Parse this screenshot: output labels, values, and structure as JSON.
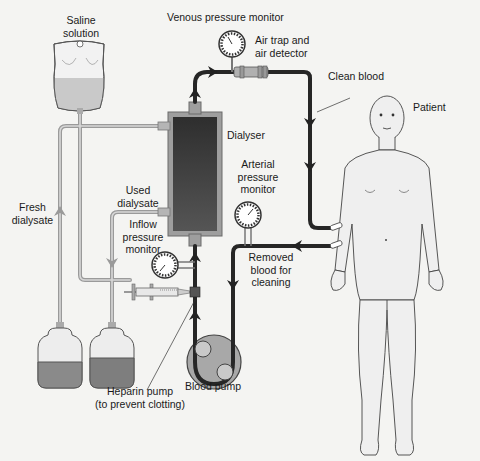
{
  "diagram": {
    "colors": {
      "background": "#f4f4f2",
      "blood_line": "#2a2a2a",
      "dialyser_inner": "#3c3c3c",
      "dialyser_outer": "#9a9a9a",
      "dialysate_tube": "#b8b8b8",
      "fluid": "#8a8a8a",
      "skin": "#e6e6e6"
    },
    "labels": {
      "saline": [
        "Saline",
        "solution"
      ],
      "venous_monitor": "Venous pressure monitor",
      "air_trap": [
        "Air trap and",
        "air detector"
      ],
      "clean_blood": "Clean blood",
      "patient": "Patient",
      "dialyser": "Dialyser",
      "arterial_monitor": [
        "Arterial",
        "pressure",
        "monitor"
      ],
      "used_dialysate": [
        "Used",
        "dialysate"
      ],
      "inflow_monitor": [
        "Inflow",
        "pressure",
        "monitor"
      ],
      "fresh_dialysate": [
        "Fresh",
        "dialysate"
      ],
      "removed_blood": [
        "Removed",
        "blood for",
        "cleaning"
      ],
      "blood_pump": "Blood pump",
      "heparin_pump": [
        "Heparin pump",
        "(to prevent clotting)"
      ]
    },
    "components": [
      {
        "id": "saline-bag",
        "name": "Saline solution bag"
      },
      {
        "id": "dialyser",
        "name": "Dialyser"
      },
      {
        "id": "venous-gauge",
        "name": "Venous pressure monitor"
      },
      {
        "id": "air-trap",
        "name": "Air trap and air detector"
      },
      {
        "id": "arterial-gauge",
        "name": "Arterial pressure monitor"
      },
      {
        "id": "inflow-gauge",
        "name": "Inflow pressure monitor"
      },
      {
        "id": "heparin-syringe",
        "name": "Heparin pump"
      },
      {
        "id": "blood-pump",
        "name": "Blood pump"
      },
      {
        "id": "fresh-dialysate-bottle",
        "name": "Fresh dialysate bottle"
      },
      {
        "id": "used-dialysate-bottle",
        "name": "Used dialysate bottle"
      },
      {
        "id": "patient",
        "name": "Patient"
      }
    ]
  }
}
